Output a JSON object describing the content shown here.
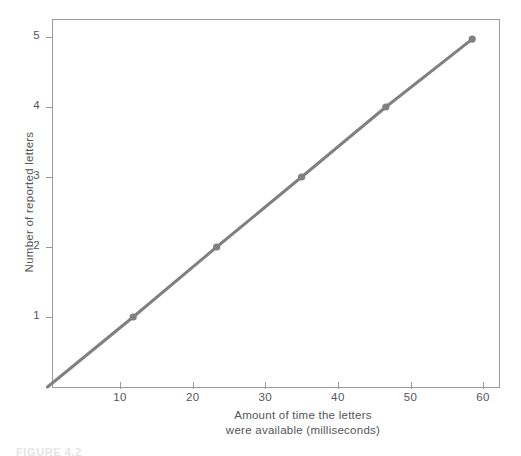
{
  "figure": {
    "caption": "FIGURE 4.2"
  },
  "chart_data": {
    "type": "line",
    "title": "",
    "xlabel_lines": [
      "Amount of time the letters",
      "were available (milliseconds)"
    ],
    "xlabel": "Amount of time the letters were available (milliseconds)",
    "ylabel": "Number of reported letters",
    "xlim": [
      0,
      63
    ],
    "ylim": [
      0,
      5.3
    ],
    "xticks": [
      10,
      20,
      30,
      40,
      50,
      60
    ],
    "xticklabels": [
      "10",
      "20",
      "30",
      "40",
      "50",
      "60"
    ],
    "yticks": [
      1,
      2,
      3,
      4,
      5
    ],
    "yticklabels": [
      "1",
      "2",
      "3",
      "4",
      "5"
    ],
    "grid": false,
    "legend": false,
    "line_color": "#808080",
    "marker_color": "#808080",
    "line_width": 3,
    "marker_size": 6,
    "series": [
      {
        "name": "reported letters",
        "points": [
          {
            "x": 0.0,
            "y": 0.0
          },
          {
            "x": 11.8,
            "y": 1.0
          },
          {
            "x": 23.3,
            "y": 2.0
          },
          {
            "x": 35.0,
            "y": 3.0
          },
          {
            "x": 46.6,
            "y": 4.0
          },
          {
            "x": 58.5,
            "y": 4.97
          }
        ],
        "markers": [
          {
            "x": 11.8,
            "y": 1.0
          },
          {
            "x": 23.3,
            "y": 2.0
          },
          {
            "x": 35.0,
            "y": 3.0
          },
          {
            "x": 46.6,
            "y": 4.0
          },
          {
            "x": 58.5,
            "y": 4.97
          }
        ]
      }
    ]
  },
  "axis": {
    "frame_color": "#9a9a9a",
    "tick_color": "#9a9a9a",
    "text_color": "#53565a"
  }
}
